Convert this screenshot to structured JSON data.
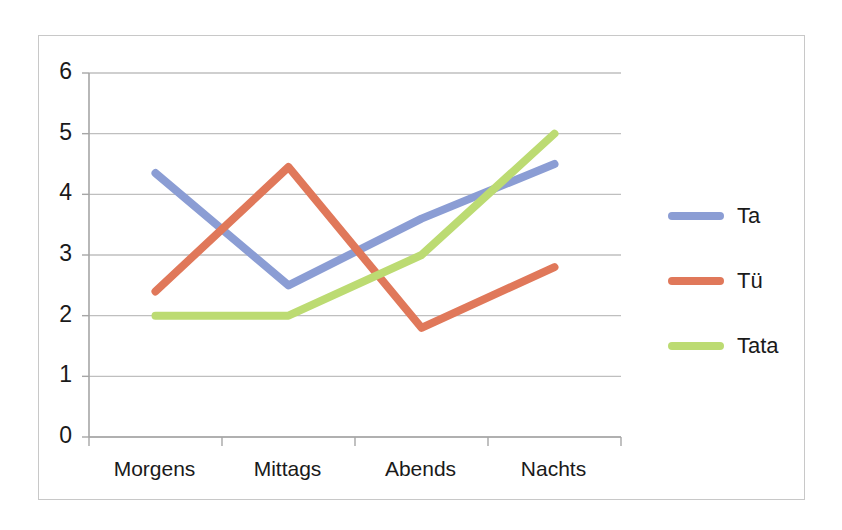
{
  "chart_data": {
    "type": "line",
    "title": "",
    "subtitle": "",
    "xlabel": "",
    "ylabel": "",
    "categories": [
      "Morgens",
      "Mittags",
      "Abends",
      "Nachts"
    ],
    "ylim": [
      0,
      6
    ],
    "yticks": [
      "0",
      "1",
      "2",
      "3",
      "4",
      "5",
      "6"
    ],
    "grid": "horizontal",
    "legend_position": "right",
    "series": [
      {
        "name": "Ta",
        "color": "#8b9dd4",
        "values": [
          4.35,
          2.5,
          3.6,
          4.5
        ]
      },
      {
        "name": "Tü",
        "color": "#e0785a",
        "values": [
          2.4,
          4.45,
          1.8,
          2.8
        ]
      },
      {
        "name": "Tata",
        "color": "#bcdb72",
        "values": [
          2.0,
          2.0,
          3.0,
          5.0
        ]
      }
    ]
  },
  "axis": {
    "line_color": "#a6a6a6",
    "grid_color": "#bfbfbf"
  },
  "frame": {
    "border_color": "#c8c8c8",
    "background": "#ffffff"
  }
}
